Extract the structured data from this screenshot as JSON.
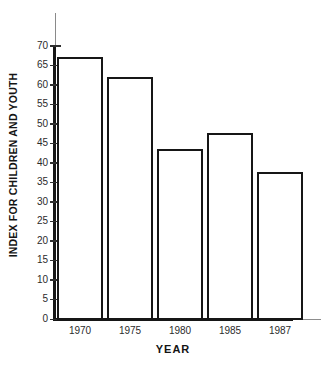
{
  "chart_data": {
    "type": "bar",
    "title": "",
    "xlabel": "YEAR",
    "ylabel": "INDEX FOR CHILDREN AND YOUTH",
    "categories": [
      "1970",
      "1975",
      "1980",
      "1985",
      "1987"
    ],
    "values": [
      67,
      62,
      43.5,
      47.5,
      37.5
    ],
    "series": [
      {
        "name": "Index for children and youth",
        "values": [
          67,
          62,
          43.5,
          47.5,
          37.5
        ]
      }
    ],
    "ylim": [
      0,
      70
    ],
    "ytick_labels": [
      "70",
      "65",
      "60",
      "55",
      "50",
      "45",
      "40",
      "35",
      "30",
      "25",
      "20",
      "15",
      "10",
      "5",
      "0"
    ],
    "ytick_values": [
      70,
      65,
      60,
      55,
      50,
      45,
      40,
      35,
      30,
      25,
      20,
      15,
      10,
      5,
      0
    ],
    "ytick_step": 5,
    "grid": false,
    "legend": false,
    "legend_position": "none",
    "bar_fill_color": "#ffffff",
    "bar_edge_color": "#161616",
    "axis_color": "#161616",
    "text_color": "#1a1a1a"
  }
}
